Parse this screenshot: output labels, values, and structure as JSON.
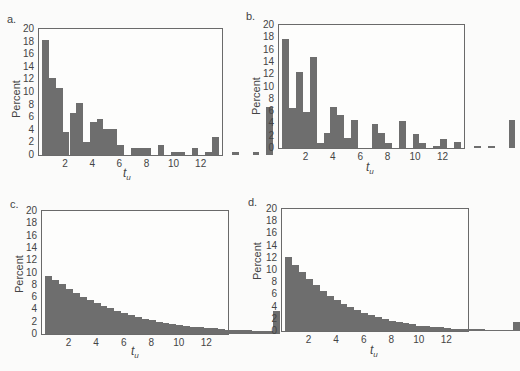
{
  "chart_data": [
    {
      "panel": "a.",
      "type": "bar",
      "xlabel": "t_u",
      "ylabel": "Percent",
      "ylim": [
        0,
        20
      ],
      "yticks": [
        0,
        2,
        4,
        6,
        8,
        10,
        12,
        14,
        16,
        18,
        20
      ],
      "xticks": [
        2,
        4,
        6,
        8,
        10,
        12
      ],
      "xlim": [
        0,
        13.5
      ],
      "bin_start": 0.25,
      "bin_width": 0.5,
      "values": [
        18.3,
        12.2,
        10.7,
        3.6,
        6.7,
        8.2,
        2.1,
        5.2,
        5.7,
        4.2,
        4.2,
        1.6,
        0,
        1.1,
        1.1,
        1.1,
        0,
        1.6,
        0,
        0.5,
        0.5,
        0,
        1.1,
        0,
        0.5,
        2.9,
        0,
        0,
        0.5,
        0,
        0,
        0.5,
        0,
        7.6
      ]
    },
    {
      "panel": "b.",
      "type": "bar",
      "xlabel": "t_u",
      "ylabel": "Percent",
      "ylim": [
        0,
        20
      ],
      "yticks": [
        0,
        2,
        4,
        6,
        8,
        10,
        12,
        14,
        16,
        18,
        20
      ],
      "xticks": [
        2,
        4,
        6,
        8,
        10,
        12
      ],
      "xlim": [
        0,
        13.5
      ],
      "bin_start": 0.25,
      "bin_width": 0.5,
      "values": [
        17.7,
        6.5,
        12.3,
        5.8,
        14.8,
        0.8,
        2.5,
        6.6,
        5.4,
        1.6,
        4.6,
        0,
        0,
        3.9,
        2.5,
        0.8,
        0,
        4.4,
        0,
        2.3,
        0.8,
        0,
        0.4,
        1.4,
        0,
        0.9,
        0,
        0,
        0.4,
        0,
        0.4,
        0,
        0,
        4.6
      ]
    },
    {
      "panel": "c.",
      "type": "bar",
      "xlabel": "t_u",
      "ylabel": "Percent",
      "ylim": [
        0,
        20
      ],
      "yticks": [
        0,
        2,
        4,
        6,
        8,
        10,
        12,
        14,
        16,
        18,
        20
      ],
      "xticks": [
        2,
        4,
        6,
        8,
        10,
        12
      ],
      "xlim": [
        0,
        13.5
      ],
      "bin_start": 0.25,
      "bin_width": 0.5,
      "values": [
        9.4,
        8.8,
        8.1,
        7.4,
        6.7,
        6.1,
        5.6,
        5.1,
        4.6,
        4.2,
        3.8,
        3.4,
        3.1,
        2.8,
        2.5,
        2.3,
        2.0,
        1.8,
        1.6,
        1.5,
        1.3,
        1.2,
        1.1,
        1.0,
        0.9,
        0.8,
        0.7,
        0.7,
        0.6,
        0.6,
        0.5,
        0.5,
        0.5,
        3.8
      ]
    },
    {
      "panel": "d.",
      "type": "bar",
      "xlabel": "t_u",
      "ylabel": "Percent",
      "ylim": [
        0,
        20
      ],
      "yticks": [
        0,
        2,
        4,
        6,
        8,
        10,
        12,
        14,
        16,
        18,
        20
      ],
      "xticks": [
        2,
        4,
        6,
        8,
        10,
        12
      ],
      "xlim": [
        0,
        13.5
      ],
      "bin_start": 0.25,
      "bin_width": 0.5,
      "values": [
        12.2,
        10.8,
        9.6,
        8.5,
        7.5,
        6.6,
        5.8,
        5.1,
        4.5,
        3.9,
        3.4,
        3.0,
        2.6,
        2.3,
        2.0,
        1.7,
        1.5,
        1.3,
        1.1,
        0.9,
        0.8,
        0.7,
        0.6,
        0.5,
        0.4,
        0.4,
        0.3,
        0.3,
        0.3,
        0.2,
        0.2,
        0.2,
        0.2,
        1.5
      ]
    }
  ],
  "panels": [
    {
      "label": "a.",
      "ylabel": "Percent",
      "xlabel_main": "t",
      "xlabel_sub": "u"
    },
    {
      "label": "b.",
      "ylabel": "Percent",
      "xlabel_main": "t",
      "xlabel_sub": "u"
    },
    {
      "label": "c.",
      "ylabel": "Percent",
      "xlabel_main": "t",
      "xlabel_sub": "u"
    },
    {
      "label": "d.",
      "ylabel": "Percent",
      "xlabel_main": "t",
      "xlabel_sub": "u"
    }
  ]
}
